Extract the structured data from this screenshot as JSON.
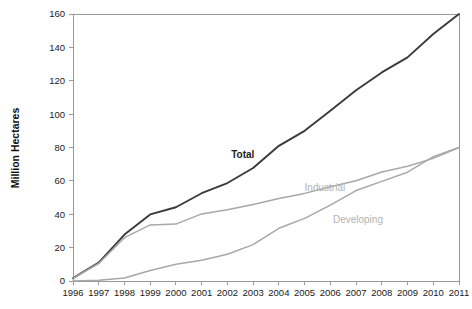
{
  "chart_data": {
    "type": "line",
    "title": "",
    "xlabel": "",
    "ylabel": "Million Hectares",
    "xlim": [
      1996,
      2011
    ],
    "ylim": [
      0,
      160
    ],
    "grid": false,
    "legend_position": "inline-annotations",
    "x": [
      1996,
      1997,
      1998,
      1999,
      2000,
      2001,
      2002,
      2003,
      2004,
      2005,
      2006,
      2007,
      2008,
      2009,
      2010,
      2011
    ],
    "xticklabels": [
      "1996",
      "1997",
      "1998",
      "1999",
      "2000",
      "2001",
      "2002",
      "2003",
      "2004",
      "2005",
      "2006",
      "2007",
      "2008",
      "2009",
      "2010",
      "2011"
    ],
    "yticks": [
      0,
      20,
      40,
      60,
      80,
      100,
      120,
      140,
      160
    ],
    "yticklabels": [
      "0",
      "20",
      "40",
      "60",
      "80",
      "100",
      "120",
      "140",
      "160"
    ],
    "series": [
      {
        "name": "Total",
        "color": "#3a3a3a",
        "values": [
          1.7,
          11,
          27.8,
          39.9,
          44.2,
          52.6,
          58.7,
          67.7,
          81,
          90,
          102,
          114.3,
          125,
          134,
          148,
          160
        ],
        "label": "Total",
        "label_x": 2003.05,
        "label_y": 74
      },
      {
        "name": "Industrial",
        "color": "#a8a8a8",
        "values": [
          1.7,
          10.5,
          26,
          33.6,
          34.1,
          40.2,
          42.7,
          45.9,
          49.4,
          52.5,
          56.5,
          60.1,
          65.3,
          68.8,
          73.5,
          80
        ],
        "label": "Industrial",
        "label_x": 2005.0,
        "label_y": 54
      },
      {
        "name": "Developing",
        "color": "#a8a8a8",
        "values": [
          0,
          0.5,
          1.8,
          6.3,
          10.1,
          12.4,
          16,
          21.8,
          31.6,
          37.5,
          45.5,
          54.2,
          59.7,
          65.2,
          74.5,
          80
        ],
        "label": "Developing",
        "label_x": 2006.1,
        "label_y": 35
      }
    ]
  },
  "axis": {
    "y_title": "Million Hectares"
  }
}
